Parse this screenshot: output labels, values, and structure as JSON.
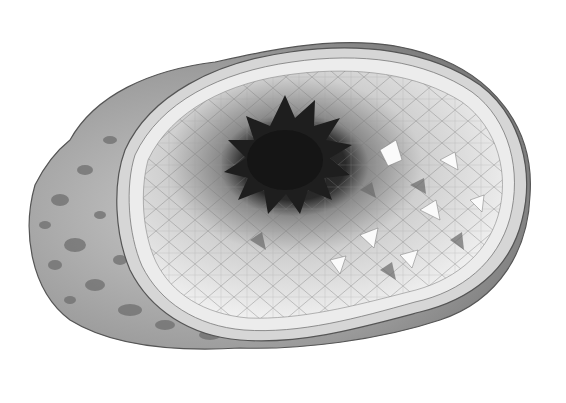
{
  "image": {
    "subject": "geode-illustration",
    "style": "grayscale pencil drawing",
    "background": "#ffffff",
    "colors": {
      "outer_rock": "#9a9a9a",
      "rock_spots": "#6e6e6e",
      "rind_outer": "#bdbdbd",
      "rind_inner": "#e2e2e2",
      "crystal_light": "#f2f2f2",
      "crystal_mid": "#b8b8b8",
      "cavity_dark": "#1e1e1e",
      "outline": "#555555"
    },
    "cavity_center": [
      285,
      165
    ]
  }
}
